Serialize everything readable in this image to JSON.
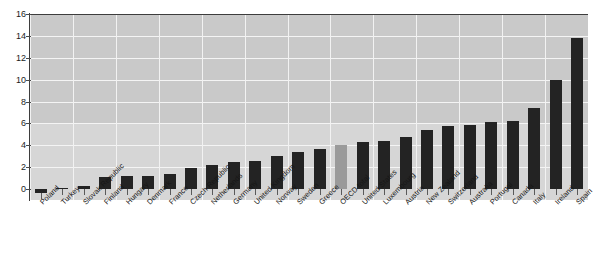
{
  "chart_data": {
    "type": "bar",
    "title": "",
    "xlabel": "",
    "ylabel": "",
    "ylim": [
      -1,
      16
    ],
    "yticks": [
      0,
      2,
      4,
      6,
      8,
      10,
      12,
      14,
      16
    ],
    "grid": true,
    "legend": null,
    "highlight_category": "OECD total",
    "colors": {
      "bar": "#232323",
      "highlight_bar": "#9a9a9a",
      "plot_background": "#c9c9c9",
      "plot_background_lower": "#d6d6d6",
      "gridline": "#f4f4f4",
      "axis": "#3d3d3d"
    },
    "categories": [
      "Poland",
      "Turkey",
      "Slovak Republic",
      "Finland",
      "Hungary",
      "Denmark",
      "France",
      "Czech Republic",
      "Netherlands",
      "Germany",
      "United Kingdom",
      "Norway",
      "Sweden",
      "Greece",
      "OECD total",
      "United States",
      "Luxembourg",
      "Austria",
      "New Zealand",
      "Switzerland",
      "Australia",
      "Portugal",
      "Canada",
      "Italy",
      "Ireland",
      "Spain"
    ],
    "values": [
      -0.4,
      0.05,
      0.3,
      1.1,
      1.2,
      1.2,
      1.4,
      1.9,
      2.2,
      2.5,
      2.6,
      3.0,
      3.4,
      3.7,
      4.0,
      4.3,
      4.4,
      4.8,
      5.4,
      5.8,
      5.9,
      6.1,
      6.2,
      7.4,
      10.0,
      13.8
    ]
  },
  "axis": {
    "y_tick_labels": [
      "16",
      "14",
      "12",
      "10",
      "8",
      "6",
      "4",
      "2",
      "0"
    ]
  }
}
